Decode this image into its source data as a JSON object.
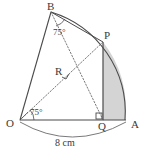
{
  "figure": {
    "background_color": "#ffffff",
    "stroke_color": "#4a4a4a",
    "shaded_fill": "#d4d4d4",
    "shaded_region_name": "segment-QAP",
    "points": {
      "O": {
        "label": "O",
        "x": 20,
        "y": 120
      },
      "A": {
        "label": "A",
        "x": 125,
        "y": 120
      },
      "B": {
        "label": "B",
        "x": 51,
        "y": 12
      },
      "P": {
        "label": "P",
        "x": 103,
        "y": 42
      },
      "Q": {
        "label": "Q",
        "x": 103,
        "y": 120
      },
      "R": {
        "label": "R",
        "x": 62,
        "y": 72
      }
    },
    "angles": [
      {
        "name": "angle-at-B",
        "value": "75°",
        "vertex": "B"
      },
      {
        "name": "angle-at-O",
        "value": "75°",
        "vertex": "O"
      }
    ],
    "right_angles": [
      {
        "name": "right-angle-at-R",
        "vertex": "R"
      },
      {
        "name": "right-angle-at-Q",
        "vertex": "Q"
      }
    ],
    "dimension": {
      "name": "radius-OA",
      "text": "8 cm"
    },
    "solid_lines": [
      "OB",
      "OA",
      "PQ"
    ],
    "dotted_lines": [
      "OP",
      "BQ"
    ],
    "arcs": [
      "arc-B-P-A",
      "brace-O-A"
    ]
  }
}
